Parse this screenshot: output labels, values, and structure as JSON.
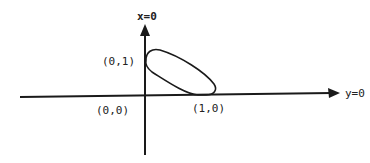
{
  "diagram": {
    "axes": {
      "vertical_label": "x=0",
      "horizontal_label": "y=0"
    },
    "points": {
      "origin": "(0,0)",
      "on_vertical": "(0,1)",
      "on_horizontal": "(1,0)"
    },
    "colors": {
      "stroke": "#1a1a1a",
      "background": "#ffffff"
    }
  }
}
